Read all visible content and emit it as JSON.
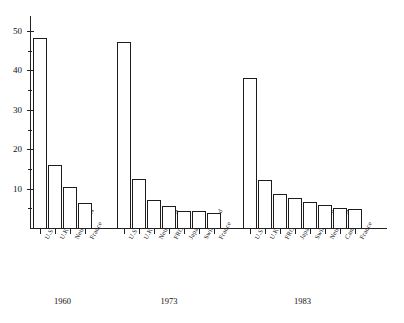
{
  "chart_data": {
    "type": "bar",
    "title": "",
    "subtitle": "",
    "xlabel": "",
    "ylabel": "",
    "ylim": [
      0,
      54
    ],
    "grid": false,
    "legend": "none",
    "y_ticks_major": [
      10,
      20,
      30,
      40,
      50
    ],
    "y_tick_labels": [
      "10",
      "20",
      "30",
      "40",
      "50"
    ],
    "y_ticks_minor": [
      5,
      15,
      25,
      35,
      45
    ],
    "groups": [
      {
        "label": "1960",
        "categories": [
          "U.S",
          "U.K",
          "Netherlands",
          "France"
        ],
        "values": [
          48.3,
          16.0,
          10.5,
          6.3
        ]
      },
      {
        "label": "1973",
        "categories": [
          "U.S",
          "U.K",
          "Netherlands",
          "FRG",
          "Japan",
          "Switzerland",
          "France"
        ],
        "values": [
          47.2,
          12.4,
          7.2,
          5.5,
          4.4,
          4.4,
          3.8
        ]
      },
      {
        "label": "1983",
        "categories": [
          "U.S",
          "U.K",
          "FRG",
          "Japan",
          "Switzerland",
          "Netherlands",
          "Canada",
          "France"
        ],
        "values": [
          38.0,
          12.3,
          8.7,
          7.6,
          6.7,
          5.9,
          5.1,
          4.8
        ]
      }
    ],
    "colors": {
      "bar_fill": "#ffffff",
      "bar_stroke": "#1c1c1c",
      "axis": "#222222",
      "text": "#111111",
      "background": "#ffffff"
    }
  }
}
